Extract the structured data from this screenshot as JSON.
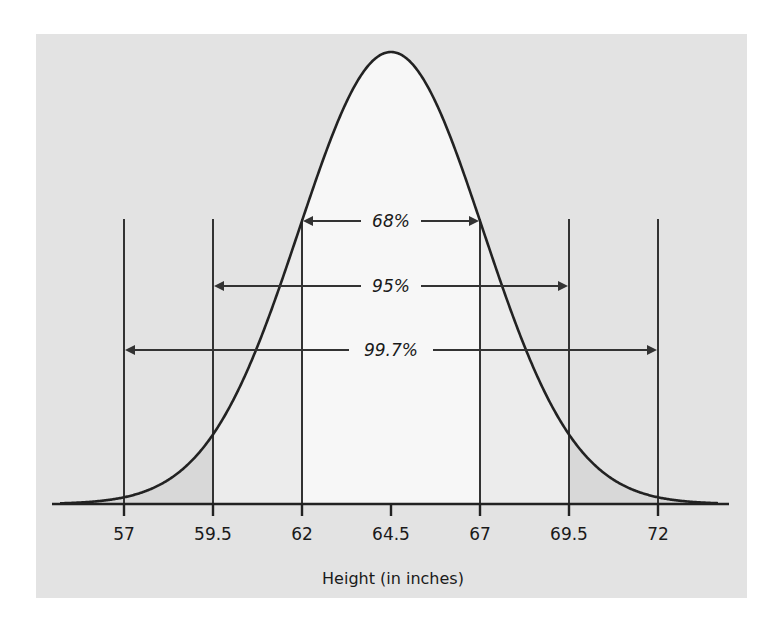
{
  "chart_data": {
    "type": "area",
    "title": "",
    "xlabel": "Height (in inches)",
    "ylabel": "",
    "distribution": "normal",
    "mean": 64.5,
    "sd": 2.5,
    "x_ticks": [
      57,
      59.5,
      62,
      64.5,
      67,
      69.5,
      72
    ],
    "x_tick_labels": [
      "57",
      "59.5",
      "62",
      "64.5",
      "67",
      "69.5",
      "72"
    ],
    "xlim": [
      55,
      74
    ],
    "grid": false,
    "legend": null,
    "intervals": [
      {
        "label": "68%",
        "from": 62,
        "to": 67,
        "sd_range": 1
      },
      {
        "label": "95%",
        "from": 59.5,
        "to": 69.5,
        "sd_range": 2
      },
      {
        "label": "99.7%",
        "from": 57,
        "to": 72,
        "sd_range": 3
      }
    ]
  },
  "colors": {
    "panel_bg": "#e3e3e3",
    "inner_band": "#f7f7f7",
    "middle_band": "#ececec",
    "outer_tail": "#d8d8d8",
    "ink": "#2a2a2a"
  }
}
